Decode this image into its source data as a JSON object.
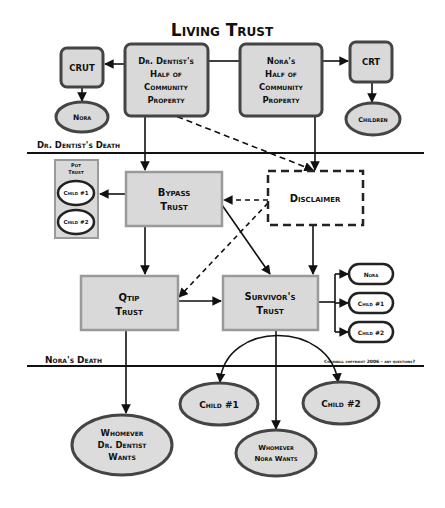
{
  "diagram": {
    "top_title_partial": "",
    "title": "Living Trust",
    "colors": {
      "box_fill": "#d9d9d9",
      "box_border_light": "#9a9a9a",
      "box_border_dark": "#444444",
      "line": "#111111",
      "ellipse_fill": "#dcdcdc",
      "ellipse_white_fill": "#ffffff"
    },
    "nodes": {
      "crut": "CRUT",
      "dr_half": [
        "Dr. Dentist's",
        "Half of",
        "Community",
        "Property"
      ],
      "nora_half": [
        "Nora's",
        "Half of",
        "Community",
        "Property"
      ],
      "crt": "CRT",
      "nora_left": "Nora",
      "children": "Children",
      "pot_trust": [
        "Pot",
        "Trust"
      ],
      "pot_child1": "Child #1",
      "pot_child2": "Child #2",
      "bypass": [
        "Bypass",
        "Trust"
      ],
      "disclaimer": "Disclaimer",
      "qtip": [
        "Qtip",
        "Trust"
      ],
      "survivor": [
        "Survivor's",
        "Trust"
      ],
      "right_nora": "Nora",
      "right_child1": "Child #1",
      "right_child2": "Child #2",
      "bottom_child1": "Child #1",
      "bottom_child2": "Child #2",
      "whomever_dr": [
        "Whomever",
        "Dr. Dentist",
        "Wants"
      ],
      "whomever_nora": [
        "Whomever",
        "Nora Wants"
      ]
    },
    "events": {
      "dr_death": "Dr. Dentist's Death",
      "nora_death": "Nora's Death"
    },
    "copyright": "Cornwall copyright 2006 - any questions?"
  }
}
